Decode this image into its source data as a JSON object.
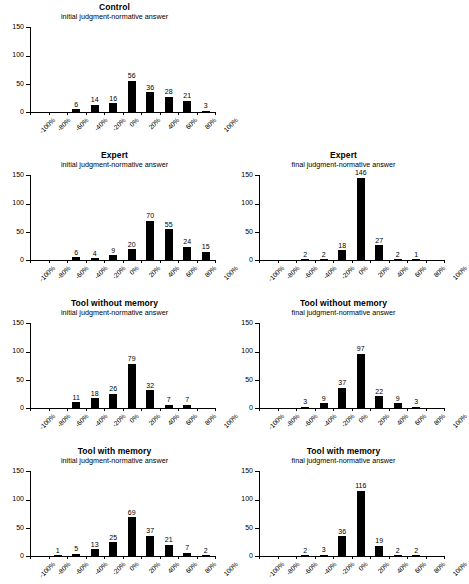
{
  "figure": {
    "subtitle_initial": "initial judgment-normative answer",
    "subtitle_final": "final judgment-normative answer",
    "y_ticks": [
      0,
      50,
      100,
      150
    ],
    "x_tick_labels": [
      "-100%",
      "-80%",
      "-60%",
      "-40%",
      "-20%",
      "0%",
      "20%",
      "40%",
      "60%",
      "80%",
      "100%"
    ],
    "bar_color": "#000000",
    "axis_color": "#000000"
  },
  "chart_data": [
    {
      "id": "control-initial",
      "type": "bar",
      "title": "Control",
      "subtitle": "initial judgment-normative answer",
      "xlabel": "",
      "ylabel": "",
      "ylim": [
        0,
        150
      ],
      "yticks": [
        0,
        50,
        100,
        150
      ],
      "grid": false,
      "legend": "none",
      "categories": [
        "-100%",
        "-80%",
        "-60%",
        "-40%",
        "-20%",
        "0%",
        "20%",
        "40%",
        "60%",
        "80%"
      ],
      "values": [
        0,
        0,
        6,
        14,
        16,
        56,
        36,
        28,
        21,
        3
      ],
      "bar_labels": [
        "",
        "",
        "6",
        "14",
        "16",
        "56",
        "36",
        "28",
        "21",
        "3"
      ]
    },
    {
      "id": "expert-initial",
      "type": "bar",
      "title": "Expert",
      "subtitle": "initial judgment-normative answer",
      "xlabel": "",
      "ylabel": "",
      "ylim": [
        0,
        150
      ],
      "yticks": [
        0,
        50,
        100,
        150
      ],
      "grid": false,
      "legend": "none",
      "categories": [
        "-100%",
        "-80%",
        "-60%",
        "-40%",
        "-20%",
        "0%",
        "20%",
        "40%",
        "60%",
        "80%"
      ],
      "values": [
        0,
        0,
        6,
        4,
        9,
        20,
        70,
        55,
        24,
        15
      ],
      "bar_labels": [
        "",
        "",
        "6",
        "4",
        "9",
        "20",
        "70",
        "55",
        "24",
        "15"
      ]
    },
    {
      "id": "expert-final",
      "type": "bar",
      "title": "Expert",
      "subtitle": "final judgment-normative answer",
      "xlabel": "",
      "ylabel": "",
      "ylim": [
        0,
        150
      ],
      "yticks": [
        0,
        50,
        100,
        150
      ],
      "grid": false,
      "legend": "none",
      "categories": [
        "-100%",
        "-80%",
        "-60%",
        "-40%",
        "-20%",
        "0%",
        "20%",
        "40%",
        "60%",
        "80%"
      ],
      "values": [
        0,
        0,
        2,
        2,
        18,
        146,
        27,
        2,
        1,
        0
      ],
      "bar_labels": [
        "",
        "",
        "2",
        "2",
        "18",
        "146",
        "27",
        "2",
        "1",
        ""
      ]
    },
    {
      "id": "tool-without-memory-initial",
      "type": "bar",
      "title": "Tool without memory",
      "subtitle": "initial judgment-normative answer",
      "xlabel": "",
      "ylabel": "",
      "ylim": [
        0,
        150
      ],
      "yticks": [
        0,
        50,
        100,
        150
      ],
      "grid": false,
      "legend": "none",
      "categories": [
        "-100%",
        "-80%",
        "-60%",
        "-40%",
        "-20%",
        "0%",
        "20%",
        "40%",
        "60%",
        "80%"
      ],
      "values": [
        0,
        0,
        11,
        18,
        26,
        79,
        32,
        7,
        7,
        0
      ],
      "bar_labels": [
        "",
        "",
        "11",
        "18",
        "26",
        "79",
        "32",
        "7",
        "7",
        ""
      ]
    },
    {
      "id": "tool-without-memory-final",
      "type": "bar",
      "title": "Tool without memory",
      "subtitle": "final judgment-normative answer",
      "xlabel": "",
      "ylabel": "",
      "ylim": [
        0,
        150
      ],
      "yticks": [
        0,
        50,
        100,
        150
      ],
      "grid": false,
      "legend": "none",
      "categories": [
        "-100%",
        "-80%",
        "-60%",
        "-40%",
        "-20%",
        "0%",
        "20%",
        "40%",
        "60%",
        "80%"
      ],
      "values": [
        0,
        0,
        3,
        9,
        37,
        97,
        22,
        9,
        3,
        0
      ],
      "bar_labels": [
        "",
        "",
        "3",
        "9",
        "37",
        "97",
        "22",
        "9",
        "3",
        ""
      ]
    },
    {
      "id": "tool-with-memory-initial",
      "type": "bar",
      "title": "Tool with memory",
      "subtitle": "initial judgment-normative answer",
      "xlabel": "",
      "ylabel": "",
      "ylim": [
        0,
        150
      ],
      "yticks": [
        0,
        50,
        100,
        150
      ],
      "grid": false,
      "legend": "none",
      "categories": [
        "-100%",
        "-80%",
        "-60%",
        "-40%",
        "-20%",
        "0%",
        "20%",
        "40%",
        "60%",
        "80%"
      ],
      "values": [
        0,
        1,
        5,
        13,
        25,
        69,
        37,
        21,
        7,
        2
      ],
      "bar_labels": [
        "",
        "1",
        "5",
        "13",
        "25",
        "69",
        "37",
        "21",
        "7",
        "2"
      ]
    },
    {
      "id": "tool-with-memory-final",
      "type": "bar",
      "title": "Tool with memory",
      "subtitle": "final judgment-normative answer",
      "xlabel": "",
      "ylabel": "",
      "ylim": [
        0,
        150
      ],
      "yticks": [
        0,
        50,
        100,
        150
      ],
      "grid": false,
      "legend": "none",
      "categories": [
        "-100%",
        "-80%",
        "-60%",
        "-40%",
        "-20%",
        "0%",
        "20%",
        "40%",
        "60%",
        "80%"
      ],
      "values": [
        0,
        0,
        2,
        3,
        36,
        116,
        19,
        2,
        2,
        0
      ],
      "bar_labels": [
        "",
        "",
        "2",
        "3",
        "36",
        "116",
        "19",
        "2",
        "2",
        ""
      ]
    }
  ]
}
